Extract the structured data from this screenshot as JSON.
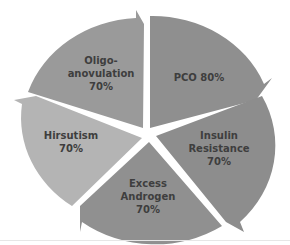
{
  "diagram": {
    "type": "cycle-pie",
    "segments": [
      {
        "id": "pco",
        "lines": [
          "PCO 80%"
        ],
        "label": "PCO",
        "value": "80%",
        "color": "#8f8f8f"
      },
      {
        "id": "insulin",
        "lines": [
          "Insulin",
          "Resistance",
          "70%"
        ],
        "label": "Insulin Resistance",
        "value": "70%",
        "color": "#8d8d8d"
      },
      {
        "id": "androgen",
        "lines": [
          "Excess",
          "Androgen",
          "70%"
        ],
        "label": "Excess Androgen",
        "value": "70%",
        "color": "#909090"
      },
      {
        "id": "hirsutism",
        "lines": [
          "Hirsutism",
          "70%"
        ],
        "label": "Hirsutism",
        "value": "70%",
        "color": "#b4b4b4"
      },
      {
        "id": "oligo",
        "lines": [
          "Oligo-",
          "anovulation",
          "70%"
        ],
        "label": "Oligo-anovulation",
        "value": "70%",
        "color": "#9a9a9a"
      }
    ]
  }
}
